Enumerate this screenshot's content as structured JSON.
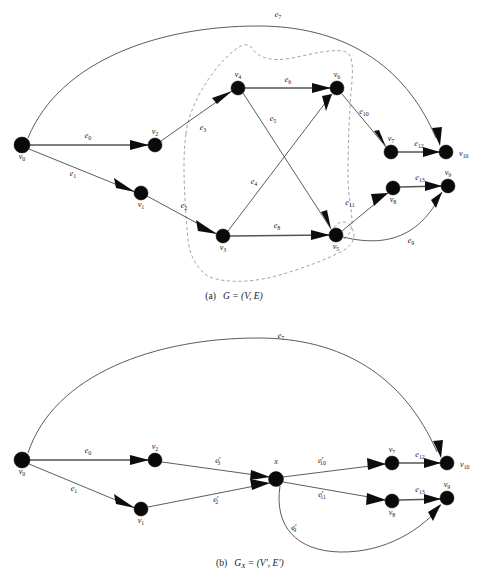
{
  "figure": {
    "kind": "graph-contraction-illustration",
    "panels": [
      {
        "id": "panel-a",
        "caption_prefix": "(a)",
        "caption_body": "G = (V, E)",
        "caption_x": 234,
        "caption_y": 299,
        "nodes": [
          {
            "id": "v0",
            "label": "v",
            "sub": "0",
            "x": 22,
            "y": 145,
            "r": 8.0,
            "lx": 22,
            "ly": 159,
            "anchor": "middle"
          },
          {
            "id": "v1",
            "label": "v",
            "sub": "1",
            "x": 141,
            "y": 193,
            "r": 7.0,
            "lx": 141,
            "ly": 207,
            "anchor": "middle"
          },
          {
            "id": "v2",
            "label": "v",
            "sub": "2",
            "x": 155,
            "y": 145,
            "r": 7.0,
            "lx": 155,
            "ly": 134,
            "anchor": "middle"
          },
          {
            "id": "v3",
            "label": "v",
            "sub": "3",
            "x": 223,
            "y": 236,
            "r": 7.0,
            "lx": 223,
            "ly": 250,
            "anchor": "middle"
          },
          {
            "id": "v4",
            "label": "v",
            "sub": "4",
            "x": 238,
            "y": 88,
            "r": 7.0,
            "lx": 238,
            "ly": 77,
            "anchor": "middle"
          },
          {
            "id": "v5",
            "label": "v",
            "sub": "5",
            "x": 336,
            "y": 235,
            "r": 7.0,
            "lx": 336,
            "ly": 249,
            "anchor": "middle"
          },
          {
            "id": "v6",
            "label": "v",
            "sub": "6",
            "x": 337,
            "y": 88,
            "r": 7.0,
            "lx": 337,
            "ly": 77,
            "anchor": "middle"
          },
          {
            "id": "v7",
            "label": "v",
            "sub": "7",
            "x": 391,
            "y": 152,
            "r": 7.0,
            "lx": 391,
            "ly": 141,
            "anchor": "middle"
          },
          {
            "id": "v8",
            "label": "v",
            "sub": "8",
            "x": 393,
            "y": 188,
            "r": 7.0,
            "lx": 393,
            "ly": 202,
            "anchor": "middle"
          },
          {
            "id": "v9",
            "label": "v",
            "sub": "9",
            "x": 448,
            "y": 186,
            "r": 7.0,
            "lx": 448,
            "ly": 175,
            "anchor": "middle"
          },
          {
            "id": "v10",
            "label": "v",
            "sub": "10",
            "x": 446,
            "y": 152,
            "r": 7.0,
            "lx": 459,
            "ly": 156,
            "anchor": "start"
          }
        ],
        "edges": [
          {
            "id": "e0",
            "label": "e",
            "sub": "0",
            "prime": "",
            "from": "v0",
            "to": "v2",
            "lx": 88,
            "ly": 138,
            "thick": true
          },
          {
            "id": "e1",
            "label": "e",
            "sub": "1",
            "prime": "",
            "from": "v0",
            "to": "v1",
            "lx": 73,
            "ly": 176,
            "thick": false
          },
          {
            "id": "e2",
            "label": "e",
            "sub": "2",
            "prime": "",
            "from": "v1",
            "to": "v3",
            "lx": 184,
            "ly": 208,
            "thick": false
          },
          {
            "id": "e3",
            "label": "e",
            "sub": "3",
            "prime": "",
            "from": "v2",
            "to": "v4",
            "lx": 203,
            "ly": 130,
            "thick": false
          },
          {
            "id": "e4",
            "label": "e",
            "sub": "4",
            "prime": "",
            "from": "v3",
            "to": "v6",
            "lx": 254,
            "ly": 184,
            "thick": false
          },
          {
            "id": "e5",
            "label": "e",
            "sub": "5",
            "prime": "",
            "from": "v4",
            "to": "v5",
            "lx": 273,
            "ly": 121,
            "thick": false
          },
          {
            "id": "e6",
            "label": "e",
            "sub": "6",
            "prime": "",
            "from": "v4",
            "to": "v6",
            "lx": 288,
            "ly": 82,
            "thick": true
          },
          {
            "id": "e7",
            "label": "e",
            "sub": "7",
            "prime": "",
            "from": "v0",
            "to": "v10",
            "lx": 278,
            "ly": 17,
            "thick": false
          },
          {
            "id": "e8",
            "label": "e",
            "sub": "8",
            "prime": "",
            "from": "v3",
            "to": "v5",
            "lx": 277,
            "ly": 228,
            "thick": true
          },
          {
            "id": "e9",
            "label": "e",
            "sub": "9",
            "prime": "",
            "from": "v5",
            "to": "v9",
            "lx": 411,
            "ly": 243,
            "thick": false
          },
          {
            "id": "e10",
            "label": "e",
            "sub": "10",
            "prime": "",
            "from": "v6",
            "to": "v7",
            "lx": 364,
            "ly": 114,
            "thick": false
          },
          {
            "id": "e11",
            "label": "e",
            "sub": "11",
            "prime": "",
            "from": "v5",
            "to": "v8",
            "lx": 350,
            "ly": 205,
            "thick": false
          },
          {
            "id": "e12",
            "label": "e",
            "sub": "12",
            "prime": "",
            "from": "v7",
            "to": "v10",
            "lx": 419,
            "ly": 146,
            "thick": true
          },
          {
            "id": "e13",
            "label": "e",
            "sub": "13",
            "prime": "",
            "from": "v8",
            "to": "v9",
            "lx": 420,
            "ly": 180,
            "thick": true
          }
        ],
        "cluster": {
          "name": "contracted-subgraph-X",
          "style": "dashed"
        }
      },
      {
        "id": "panel-b",
        "caption_prefix": "(b)",
        "caption_body": "G",
        "caption_sub": "X",
        "caption_tail": " = (V', E')",
        "caption_x": 216,
        "caption_y": 566,
        "nodes": [
          {
            "id": "v0",
            "label": "v",
            "sub": "0",
            "x": 22,
            "y": 460,
            "r": 8.0,
            "lx": 22,
            "ly": 474,
            "anchor": "middle"
          },
          {
            "id": "v1",
            "label": "v",
            "sub": "1",
            "x": 141,
            "y": 509,
            "r": 7.0,
            "lx": 141,
            "ly": 523,
            "anchor": "middle"
          },
          {
            "id": "v2",
            "label": "v",
            "sub": "2",
            "x": 155,
            "y": 460,
            "r": 7.0,
            "lx": 155,
            "ly": 449,
            "anchor": "middle"
          },
          {
            "id": "x",
            "label": "x",
            "sub": "",
            "x": 276,
            "y": 479,
            "r": 7.5,
            "lx": 276,
            "ly": 464,
            "anchor": "middle"
          },
          {
            "id": "v7",
            "label": "v",
            "sub": "7",
            "x": 392,
            "y": 463,
            "r": 7.0,
            "lx": 392,
            "ly": 452,
            "anchor": "middle"
          },
          {
            "id": "v8",
            "label": "v",
            "sub": "8",
            "x": 392,
            "y": 501,
            "r": 7.0,
            "lx": 392,
            "ly": 515,
            "anchor": "middle"
          },
          {
            "id": "v9",
            "label": "v",
            "sub": "9",
            "x": 447,
            "y": 498,
            "r": 7.0,
            "lx": 447,
            "ly": 487,
            "anchor": "middle"
          },
          {
            "id": "v10",
            "label": "v",
            "sub": "10",
            "x": 447,
            "y": 463,
            "r": 7.0,
            "lx": 460,
            "ly": 467,
            "anchor": "start"
          }
        ],
        "edges": [
          {
            "id": "e0",
            "label": "e",
            "sub": "0",
            "prime": "",
            "from": "v0",
            "to": "v2",
            "lx": 88,
            "ly": 453,
            "thick": true
          },
          {
            "id": "e1",
            "label": "e",
            "sub": "1",
            "prime": "",
            "from": "v0",
            "to": "v1",
            "lx": 74,
            "ly": 491,
            "thick": false
          },
          {
            "id": "e2p",
            "label": "e",
            "sub": "2",
            "prime": "′",
            "from": "v1",
            "to": "x",
            "lx": 216,
            "ly": 502,
            "thick": false
          },
          {
            "id": "e3p",
            "label": "e",
            "sub": "3",
            "prime": "′",
            "from": "v2",
            "to": "x",
            "lx": 218,
            "ly": 463,
            "thick": false
          },
          {
            "id": "e7",
            "label": "e",
            "sub": "7",
            "prime": "",
            "from": "v0",
            "to": "v10",
            "lx": 281,
            "ly": 338,
            "thick": false
          },
          {
            "id": "e9p",
            "label": "e",
            "sub": "9",
            "prime": "′",
            "from": "x",
            "to": "v9",
            "lx": 294,
            "ly": 530,
            "thick": false
          },
          {
            "id": "e10p",
            "label": "e",
            "sub": "10",
            "prime": "′",
            "from": "x",
            "to": "v7",
            "lx": 322,
            "ly": 463,
            "thick": false
          },
          {
            "id": "e11p",
            "label": "e",
            "sub": "11",
            "prime": "′",
            "from": "x",
            "to": "v8",
            "lx": 322,
            "ly": 497,
            "thick": false
          },
          {
            "id": "e12",
            "label": "e",
            "sub": "12",
            "prime": "",
            "from": "v7",
            "to": "v10",
            "lx": 420,
            "ly": 457,
            "thick": true
          },
          {
            "id": "e13",
            "label": "e",
            "sub": "13",
            "prime": "",
            "from": "v8",
            "to": "v9",
            "lx": 420,
            "ly": 492,
            "thick": true
          }
        ]
      }
    ],
    "colors": {
      "node_fill": "#0a0a0a",
      "edge_stroke": "#4a4a4a",
      "cluster_stroke": "#8b8b8b",
      "text": "#1a1a1a",
      "background": "#ffffff"
    }
  }
}
